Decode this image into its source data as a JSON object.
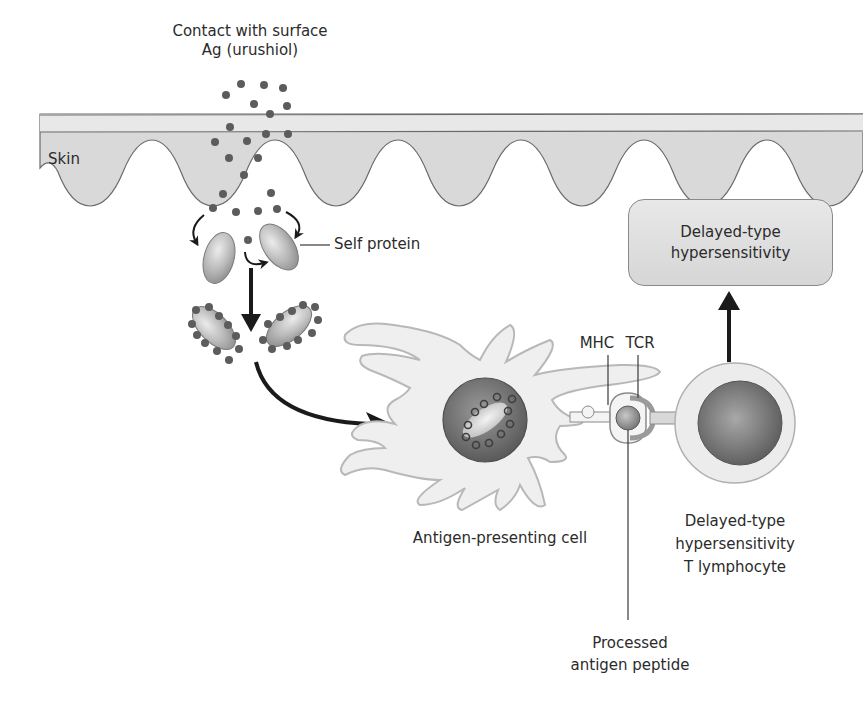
{
  "diagram": {
    "title_line1": "Contact with surface",
    "title_line2": "Ag (urushiol)",
    "skin_label": "Skin",
    "self_protein_label": "Self protein",
    "mhc_label": "MHC",
    "tcr_label": "TCR",
    "apc_label": "Antigen-presenting cell",
    "outcome_box": {
      "line1": "Delayed-type",
      "line2": "hypersensitivity"
    },
    "t_cell_label": {
      "line1": "Delayed-type",
      "line2": "hypersensitivity",
      "line3": "T lymphocyte"
    },
    "peptide_label": {
      "line1": "Processed",
      "line2": "antigen peptide"
    },
    "colors": {
      "skin_fill": "#d9d9d9",
      "skin_top_band": "#e6e6e6",
      "antigen_dot": "#5a5a5a",
      "protein_fill": "#b5b5b5",
      "apc_fill": "#efefef",
      "nucleus_fill": "#6e6e6e",
      "arrow": "#1a1a1a"
    }
  }
}
